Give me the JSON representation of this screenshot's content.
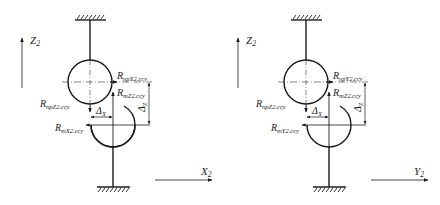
{
  "diagrams": [
    {
      "id": "left",
      "vertical_axis": {
        "letter": "Z",
        "sub": "2"
      },
      "horizontal_axis": {
        "letter": "X",
        "sub": "2"
      },
      "labels": {
        "r_np_horizontal": {
          "main": "R",
          "sub": "npX2.ccy"
        },
        "r_m_vertical": {
          "main": "R",
          "sub": "mZ2.ccy"
        },
        "r_np_vertical": {
          "main": "R",
          "sub": "npZ2.ccy"
        },
        "r_m_horizontal": {
          "main": "R",
          "sub": "mX2.ccy"
        },
        "delta_x": {
          "main": "Δ",
          "sub": "X"
        },
        "delta_z": {
          "main": "Δ",
          "sub": "Z"
        }
      }
    },
    {
      "id": "right",
      "vertical_axis": {
        "letter": "Z",
        "sub": "2"
      },
      "horizontal_axis": {
        "letter": "Y",
        "sub": "2"
      },
      "labels": {
        "r_np_horizontal": {
          "main": "R",
          "sub": "npY2.ccy"
        },
        "r_m_vertical": {
          "main": "R",
          "sub": "mZ2.ccy"
        },
        "r_np_vertical": {
          "main": "R",
          "sub": "npZ2.ccy"
        },
        "r_m_horizontal": {
          "main": "R",
          "sub": "mY2.ccy"
        },
        "delta_x": {
          "main": "Δ",
          "sub": "X"
        },
        "delta_z": {
          "main": "Δ",
          "sub": "Z"
        }
      }
    }
  ],
  "colors": {
    "line": "#1a1a1a",
    "background": "#ffffff"
  }
}
